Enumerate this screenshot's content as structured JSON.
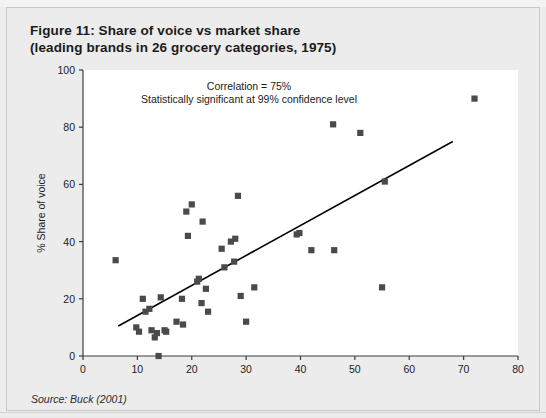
{
  "figure": {
    "title_line1": "Figure 11: Share of voice vs market share",
    "title_line2": "(leading brands in 26 grocery categories, 1975)",
    "source": "Source: Buck (2001)"
  },
  "colors": {
    "panel_background": "#ececed",
    "plot_background": "#ffffff",
    "marker": "#4a4a4a",
    "axis": "#3c3c3c",
    "trendline": "#000000",
    "text": "#1b1b1b"
  },
  "chart_data": {
    "type": "scatter",
    "title": "Figure 11: Share of voice vs market share (leading brands in 26 grocery categories, 1975)",
    "xlabel": "% Share of market",
    "ylabel": "% Share of voice",
    "xlim": [
      0,
      80
    ],
    "ylim": [
      0,
      100
    ],
    "xticks": [
      0,
      10,
      20,
      30,
      40,
      50,
      60,
      70,
      80
    ],
    "yticks": [
      0,
      20,
      40,
      60,
      80,
      100
    ],
    "grid": false,
    "legend": "none",
    "annotations": [
      "Correlation = 75%",
      "Statistically significant at 99% confidence level"
    ],
    "points": [
      {
        "x": 6.0,
        "y": 33.5
      },
      {
        "x": 9.8,
        "y": 10.0
      },
      {
        "x": 10.3,
        "y": 8.5
      },
      {
        "x": 11.0,
        "y": 20.0
      },
      {
        "x": 11.5,
        "y": 15.5
      },
      {
        "x": 12.2,
        "y": 16.5
      },
      {
        "x": 12.6,
        "y": 9.0
      },
      {
        "x": 13.2,
        "y": 6.5
      },
      {
        "x": 13.6,
        "y": 8.0
      },
      {
        "x": 13.9,
        "y": 0.0
      },
      {
        "x": 14.3,
        "y": 20.5
      },
      {
        "x": 15.0,
        "y": 9.0
      },
      {
        "x": 15.3,
        "y": 8.5
      },
      {
        "x": 17.2,
        "y": 12.0
      },
      {
        "x": 18.2,
        "y": 20.0
      },
      {
        "x": 18.4,
        "y": 11.0
      },
      {
        "x": 19.0,
        "y": 50.5
      },
      {
        "x": 19.3,
        "y": 42.0
      },
      {
        "x": 20.0,
        "y": 53.0
      },
      {
        "x": 21.0,
        "y": 26.0
      },
      {
        "x": 21.3,
        "y": 27.0
      },
      {
        "x": 21.8,
        "y": 18.5
      },
      {
        "x": 22.0,
        "y": 47.0
      },
      {
        "x": 22.6,
        "y": 23.5
      },
      {
        "x": 23.0,
        "y": 15.5
      },
      {
        "x": 25.5,
        "y": 37.5
      },
      {
        "x": 26.0,
        "y": 31.0
      },
      {
        "x": 27.2,
        "y": 40.0
      },
      {
        "x": 27.8,
        "y": 33.0
      },
      {
        "x": 28.0,
        "y": 41.0
      },
      {
        "x": 28.5,
        "y": 56.0
      },
      {
        "x": 29.0,
        "y": 21.0
      },
      {
        "x": 30.0,
        "y": 12.0
      },
      {
        "x": 31.5,
        "y": 24.0
      },
      {
        "x": 39.3,
        "y": 42.5
      },
      {
        "x": 39.8,
        "y": 43.0
      },
      {
        "x": 42.0,
        "y": 37.0
      },
      {
        "x": 46.0,
        "y": 81.0
      },
      {
        "x": 46.2,
        "y": 37.0
      },
      {
        "x": 51.0,
        "y": 78.0
      },
      {
        "x": 55.0,
        "y": 24.0
      },
      {
        "x": 55.5,
        "y": 61.0
      },
      {
        "x": 72.0,
        "y": 90.0
      }
    ],
    "trendline": {
      "x0": 6.5,
      "y0": 10.5,
      "x1": 68.0,
      "y1": 75.0
    }
  }
}
